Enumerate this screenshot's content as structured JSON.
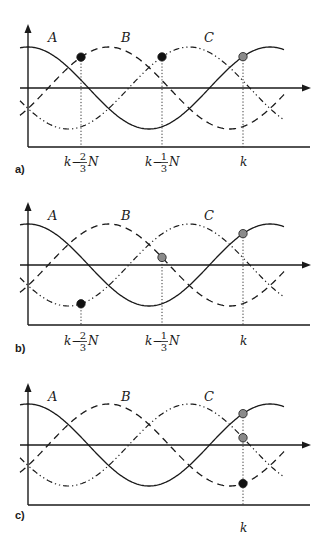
{
  "figure": {
    "curve_labels": {
      "a": "A",
      "b": "B",
      "c": "C"
    },
    "colors": {
      "line": "#1a1a1a",
      "dot_black": "#111111",
      "dot_gray": "#8a8a8a"
    },
    "panels": [
      {
        "id": "a",
        "label": "a)",
        "ticks": [
          {
            "prefix": "k−",
            "num": "2",
            "den": "3",
            "suffix": "N",
            "x": 81
          },
          {
            "prefix": "k−",
            "num": "1",
            "den": "3",
            "suffix": "N",
            "x": 162
          },
          {
            "prefix": "k",
            "num": "",
            "den": "",
            "suffix": "",
            "x": 243
          }
        ],
        "dots": [
          {
            "curve": "B",
            "x": 81,
            "color": "black"
          },
          {
            "curve": "C",
            "x": 162,
            "color": "black"
          },
          {
            "curve": "A",
            "x": 243,
            "color": "gray"
          }
        ]
      },
      {
        "id": "b",
        "label": "b)",
        "ticks": [
          {
            "prefix": "k−",
            "num": "2",
            "den": "3",
            "suffix": "N",
            "x": 81
          },
          {
            "prefix": "k−",
            "num": "1",
            "den": "3",
            "suffix": "N",
            "x": 162
          },
          {
            "prefix": "k",
            "num": "",
            "den": "",
            "suffix": "",
            "x": 243
          }
        ],
        "dots": [
          {
            "curve": "C",
            "x": 81,
            "color": "black"
          },
          {
            "curve": "B",
            "x": 162,
            "color": "gray"
          },
          {
            "curve": "A",
            "x": 243,
            "color": "gray"
          }
        ]
      },
      {
        "id": "c",
        "label": "c)",
        "ticks": [
          {
            "prefix": "k",
            "num": "",
            "den": "",
            "suffix": "",
            "x": 243
          }
        ],
        "dots": [
          {
            "curve": "A",
            "x": 243,
            "color": "gray"
          },
          {
            "curve": "C",
            "x": 243,
            "color": "gray"
          },
          {
            "curve": "B",
            "x": 243,
            "color": "black"
          }
        ]
      }
    ]
  }
}
